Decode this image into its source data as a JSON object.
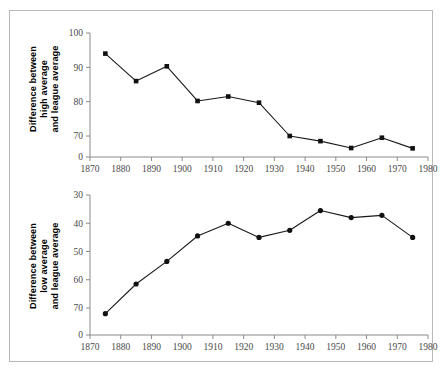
{
  "figure": {
    "background_color": "#ffffff",
    "border_color": "#b9b9b9",
    "line_color": "#1a1a1a",
    "axis_color": "#8a8a8a"
  },
  "chart_data": [
    {
      "type": "line",
      "title": "",
      "xlabel": "",
      "ylabel": "Difference between high average and league average",
      "ylabel_lines": [
        "Difference between",
        "high average",
        "and league average"
      ],
      "x": [
        1875,
        1885,
        1895,
        1905,
        1915,
        1925,
        1935,
        1945,
        1955,
        1965,
        1975
      ],
      "values": [
        94,
        86,
        90.3,
        80.2,
        81.5,
        79.7,
        70,
        68.5,
        66.5,
        69.5,
        66.4
      ],
      "xlim": [
        1870,
        1980
      ],
      "ylim": [
        70,
        100
      ],
      "xticks": [
        1870,
        1880,
        1890,
        1900,
        1910,
        1920,
        1930,
        1940,
        1950,
        1960,
        1970,
        1980
      ],
      "xtick_labels": [
        "1870",
        "1880",
        "1890",
        "1900",
        "1910",
        "1920",
        "1930",
        "1940",
        "1950",
        "1960",
        "1970",
        "1980"
      ],
      "yticks": [
        0,
        70,
        80,
        90,
        100
      ],
      "ytick_labels": [
        "0",
        "70",
        "80",
        "90",
        "100"
      ],
      "y_axis_broken": true,
      "y_inverted": false,
      "grid": false,
      "legend": "none",
      "marker": "square"
    },
    {
      "type": "line",
      "title": "",
      "xlabel": "",
      "ylabel": "Difference between low average and league average",
      "ylabel_lines": [
        "Difference between",
        "low average",
        "and league average"
      ],
      "x": [
        1875,
        1885,
        1895,
        1905,
        1915,
        1925,
        1935,
        1945,
        1955,
        1965,
        1975
      ],
      "values": [
        72,
        61.5,
        53.5,
        44.5,
        40,
        45,
        42.5,
        35.5,
        38,
        37.2,
        45
      ],
      "xlim": [
        1870,
        1980
      ],
      "ylim": [
        30,
        70
      ],
      "xticks": [
        1870,
        1880,
        1890,
        1900,
        1910,
        1920,
        1930,
        1940,
        1950,
        1960,
        1970,
        1980
      ],
      "xtick_labels": [
        "1870",
        "1880",
        "1890",
        "1900",
        "1910",
        "1920",
        "1930",
        "1940",
        "1950",
        "1960",
        "1970",
        "1980"
      ],
      "yticks": [
        0,
        70,
        60,
        50,
        40,
        30
      ],
      "ytick_labels": [
        "0",
        "70",
        "60",
        "50",
        "40",
        "30"
      ],
      "y_axis_broken": true,
      "y_inverted": true,
      "grid": false,
      "legend": "none",
      "marker": "circle"
    }
  ]
}
